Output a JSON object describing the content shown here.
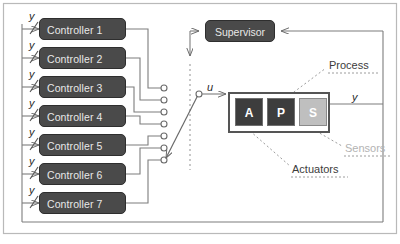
{
  "diagram": {
    "colors": {
      "box_fill": "#4a4a4a",
      "box_border": "#2e2e2e",
      "box_text": "#e8e8e8",
      "unit_dark": "#3d3d3d",
      "unit_light": "#bfbfbf",
      "line": "#6b6b6b",
      "frame": "#9a9a9a",
      "label_dark": "#3c3c3c",
      "label_gray": "#b3b3b3"
    }
  },
  "controllers": [
    {
      "label": "Controller 1",
      "input_signal": "y"
    },
    {
      "label": "Controller 2",
      "input_signal": "y"
    },
    {
      "label": "Controller 3",
      "input_signal": "y"
    },
    {
      "label": "Controller 4",
      "input_signal": "y"
    },
    {
      "label": "Controller 5",
      "input_signal": "y"
    },
    {
      "label": "Controller 6",
      "input_signal": "y"
    },
    {
      "label": "Controller 7",
      "input_signal": "y"
    }
  ],
  "supervisor": {
    "label": "Supervisor"
  },
  "process": {
    "label": "Process",
    "units": [
      {
        "label": "A",
        "name": "actuator-unit"
      },
      {
        "label": "P",
        "name": "plant-unit"
      },
      {
        "label": "S",
        "name": "sensor-unit"
      }
    ]
  },
  "annotations": {
    "process": "Process",
    "sensors": "Sensors",
    "actuators": "Actuators"
  },
  "signals": {
    "control_input": "u",
    "output": "y"
  }
}
